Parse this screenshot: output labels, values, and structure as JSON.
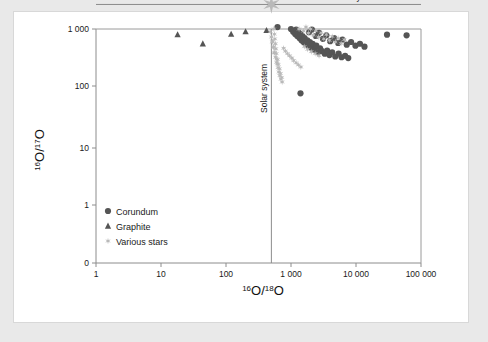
{
  "figure": {
    "background_color": "#e9e9e9",
    "card_color": "#ffffff"
  },
  "legend": {
    "items": [
      {
        "key": "corundum",
        "label": "Corundum",
        "marker": "circle",
        "color": "#555555"
      },
      {
        "key": "graphite",
        "label": "Graphite",
        "marker": "triangle",
        "color": "#555555"
      },
      {
        "key": "various_stars",
        "label": "Various stars",
        "marker": "star",
        "color": "#b9b9b9"
      }
    ]
  },
  "annotations": {
    "vertical_line_label": "Solar system",
    "horizontal_line_label": "Solar system"
  },
  "chart_data": {
    "type": "scatter",
    "title": "",
    "xlabel": "16O/18O",
    "ylabel": "16O/17O",
    "xlabel_parts": {
      "sup1": "16",
      "base1": "O/",
      "sup2": "18",
      "base2": "O"
    },
    "ylabel_parts": {
      "sup1": "16",
      "base1": "O/",
      "sup2": "17",
      "base2": "O"
    },
    "xscale": "log",
    "yscale": "log",
    "xlim": [
      1,
      100000
    ],
    "ylim": [
      0.4,
      1000
    ],
    "grid": false,
    "legend_position": "bottom-left",
    "xticks": [
      1,
      10,
      100,
      1000,
      10000,
      100000
    ],
    "xtick_labels": [
      "1",
      "10",
      "100",
      "1 000",
      "10 000",
      "100 000"
    ],
    "yticks": [
      1000,
      100,
      10,
      1,
      0.4
    ],
    "ytick_labels": [
      "1 000",
      "100",
      "10",
      "1",
      "0"
    ],
    "reference_lines": [
      {
        "name": "solar-system-vertical",
        "orientation": "vertical",
        "x": 499,
        "label": "Solar system",
        "color": "#8c8c8c"
      },
      {
        "name": "solar-system-horizontal",
        "orientation": "horizontal",
        "y": 2620,
        "label": "Solar system",
        "color": "#8c8c8c"
      }
    ],
    "sun_marker": {
      "x": 499,
      "y": 2620,
      "marker": "star",
      "color": "#b9b9b9",
      "size": 22
    },
    "series": [
      {
        "name": "Corundum",
        "marker": "circle",
        "color": "#555555",
        "points": [
          [
            560,
            2200
          ],
          [
            600,
            1900
          ],
          [
            640,
            2400
          ],
          [
            690,
            1700
          ],
          [
            720,
            2000
          ],
          [
            760,
            1500
          ],
          [
            800,
            1800
          ],
          [
            850,
            1300
          ],
          [
            880,
            1600
          ],
          [
            920,
            1150
          ],
          [
            960,
            1400
          ],
          [
            1000,
            1000
          ],
          [
            1040,
            1250
          ],
          [
            1080,
            900
          ],
          [
            1120,
            1100
          ],
          [
            1160,
            820
          ],
          [
            1200,
            980
          ],
          [
            1250,
            760
          ],
          [
            1300,
            880
          ],
          [
            1350,
            700
          ],
          [
            1400,
            820
          ],
          [
            1450,
            640
          ],
          [
            1500,
            760
          ],
          [
            1560,
            600
          ],
          [
            1620,
            700
          ],
          [
            1700,
            560
          ],
          [
            1780,
            640
          ],
          [
            1850,
            520
          ],
          [
            1950,
            600
          ],
          [
            2050,
            480
          ],
          [
            2150,
            560
          ],
          [
            2300,
            440
          ],
          [
            2450,
            520
          ],
          [
            2600,
            400
          ],
          [
            2800,
            470
          ],
          [
            3000,
            420
          ],
          [
            3300,
            380
          ],
          [
            3600,
            430
          ],
          [
            3900,
            360
          ],
          [
            4300,
            400
          ],
          [
            4800,
            340
          ],
          [
            5400,
            380
          ],
          [
            6000,
            330
          ],
          [
            6800,
            350
          ],
          [
            7600,
            320
          ],
          [
            520,
            2700
          ],
          [
            540,
            3100
          ],
          [
            580,
            2900
          ],
          [
            620,
            3400
          ],
          [
            660,
            2600
          ],
          [
            700,
            3000
          ],
          [
            740,
            2500
          ],
          [
            780,
            2800
          ],
          [
            830,
            2300
          ],
          [
            900,
            2600
          ],
          [
            980,
            2200
          ],
          [
            1060,
            2400
          ],
          [
            1150,
            2000
          ],
          [
            1240,
            2200
          ],
          [
            1340,
            1900
          ],
          [
            1460,
            2050
          ],
          [
            1600,
            1750
          ],
          [
            1750,
            1900
          ],
          [
            1900,
            1650
          ],
          [
            2100,
            1780
          ],
          [
            2350,
            1550
          ],
          [
            2600,
            1680
          ],
          [
            2900,
            1450
          ],
          [
            3200,
            1560
          ],
          [
            3600,
            1380
          ],
          [
            460,
            3600
          ],
          [
            480,
            4200
          ],
          [
            500,
            3900
          ],
          [
            520,
            4600
          ],
          [
            560,
            5200
          ],
          [
            600,
            4400
          ],
          [
            650,
            5000
          ],
          [
            700,
            4200
          ],
          [
            760,
            4800
          ],
          [
            830,
            4000
          ],
          [
            910,
            4500
          ],
          [
            1000,
            3800
          ],
          [
            1100,
            4200
          ],
          [
            1220,
            3500
          ],
          [
            1350,
            3900
          ],
          [
            1500,
            3300
          ],
          [
            1700,
            3600
          ],
          [
            1900,
            3100
          ],
          [
            2150,
            3400
          ],
          [
            2450,
            2900
          ],
          [
            420,
            2400
          ],
          [
            440,
            2000
          ],
          [
            470,
            1700
          ],
          [
            490,
            2100
          ],
          [
            510,
            1450
          ],
          [
            530,
            1750
          ],
          [
            560,
            1250
          ],
          [
            590,
            1500
          ],
          [
            620,
            1080
          ],
          [
            660,
            1300
          ],
          [
            1900,
            880
          ],
          [
            2100,
            980
          ],
          [
            2400,
            760
          ],
          [
            2700,
            860
          ],
          [
            3100,
            680
          ],
          [
            3500,
            780
          ],
          [
            4000,
            620
          ],
          [
            4600,
            700
          ],
          [
            5300,
            580
          ],
          [
            6200,
            660
          ],
          [
            7200,
            540
          ],
          [
            8400,
            600
          ],
          [
            9800,
            520
          ],
          [
            11500,
            560
          ],
          [
            13500,
            500
          ],
          [
            700,
            6200
          ],
          [
            800,
            5600
          ],
          [
            900,
            6800
          ],
          [
            1100,
            5200
          ],
          [
            1300,
            5900
          ],
          [
            1600,
            4800
          ],
          [
            2000,
            5400
          ],
          [
            2500,
            4400
          ],
          [
            3100,
            4900
          ],
          [
            3900,
            4100
          ],
          [
            30000,
            800
          ],
          [
            60000,
            780
          ],
          [
            1400,
            80
          ],
          [
            460,
            9000
          ],
          [
            430,
            13000
          ],
          [
            2300,
            10500
          ]
        ]
      },
      {
        "name": "Graphite",
        "marker": "triangle",
        "color": "#555555",
        "points": [
          [
            3.2,
            4400
          ],
          [
            9.5,
            3000
          ],
          [
            14,
            3600
          ],
          [
            21,
            2600
          ],
          [
            26,
            2400
          ],
          [
            33,
            2800
          ],
          [
            40,
            3300
          ],
          [
            48,
            2500
          ],
          [
            56,
            2200
          ],
          [
            65,
            2700
          ],
          [
            75,
            3100
          ],
          [
            86,
            2400
          ],
          [
            98,
            2100
          ],
          [
            110,
            2600
          ],
          [
            125,
            2900
          ],
          [
            140,
            2300
          ],
          [
            158,
            2000
          ],
          [
            175,
            2500
          ],
          [
            195,
            2800
          ],
          [
            215,
            2200
          ],
          [
            240,
            1950
          ],
          [
            265,
            2400
          ],
          [
            290,
            2700
          ],
          [
            315,
            2150
          ],
          [
            345,
            1900
          ],
          [
            375,
            2350
          ],
          [
            405,
            2600
          ],
          [
            440,
            2100
          ],
          [
            470,
            1850
          ],
          [
            500,
            2300
          ],
          [
            18,
            800
          ],
          [
            44,
            560
          ],
          [
            120,
            820
          ],
          [
            200,
            900
          ],
          [
            260,
            1400
          ],
          [
            310,
            1100
          ],
          [
            360,
            1250
          ],
          [
            420,
            950
          ],
          [
            480,
            1500
          ],
          [
            520,
            1200
          ],
          [
            560,
            2000
          ],
          [
            600,
            2500
          ],
          [
            640,
            1800
          ],
          [
            700,
            2200
          ],
          [
            760,
            1600
          ],
          [
            820,
            2000
          ],
          [
            900,
            1400
          ],
          [
            980,
            1750
          ],
          [
            1060,
            1250
          ],
          [
            1400,
            7000
          ],
          [
            560,
            2600
          ],
          [
            580,
            2300
          ],
          [
            610,
            2700
          ],
          [
            650,
            2050
          ]
        ]
      },
      {
        "name": "Various stars",
        "marker": "star",
        "color": "#b9b9b9",
        "points": [
          [
            499,
            2620
          ],
          [
            430,
            2500
          ],
          [
            450,
            2300
          ],
          [
            470,
            2700
          ],
          [
            490,
            2200
          ],
          [
            510,
            2900
          ],
          [
            530,
            2450
          ],
          [
            550,
            2750
          ],
          [
            570,
            2150
          ],
          [
            600,
            2500
          ],
          [
            620,
            1800
          ],
          [
            660,
            1600
          ],
          [
            700,
            1900
          ],
          [
            750,
            1500
          ],
          [
            800,
            1700
          ],
          [
            860,
            1350
          ],
          [
            920,
            1550
          ],
          [
            990,
            1200
          ],
          [
            1060,
            1400
          ],
          [
            1140,
            1100
          ],
          [
            1230,
            1300
          ],
          [
            1330,
            1000
          ],
          [
            1440,
            1180
          ],
          [
            1560,
            920
          ],
          [
            1700,
            1080
          ],
          [
            1850,
            850
          ],
          [
            2000,
            1000
          ],
          [
            2200,
            790
          ],
          [
            2400,
            930
          ],
          [
            2650,
            730
          ],
          [
            2900,
            860
          ],
          [
            3200,
            680
          ],
          [
            3500,
            800
          ],
          [
            3900,
            640
          ],
          [
            4300,
            750
          ],
          [
            4800,
            600
          ],
          [
            5300,
            700
          ],
          [
            5900,
            570
          ],
          [
            6600,
            660
          ],
          [
            520,
            1500
          ],
          [
            530,
            1250
          ],
          [
            545,
            1000
          ],
          [
            555,
            820
          ],
          [
            565,
            680
          ],
          [
            575,
            560
          ],
          [
            585,
            460
          ],
          [
            595,
            380
          ],
          [
            605,
            310
          ],
          [
            615,
            255
          ],
          [
            520,
            620
          ],
          [
            540,
            500
          ],
          [
            560,
            400
          ],
          [
            580,
            330
          ],
          [
            600,
            270
          ],
          [
            480,
            900
          ],
          [
            500,
            730
          ],
          [
            515,
            600
          ],
          [
            535,
            480
          ],
          [
            550,
            390
          ],
          [
            630,
            220
          ],
          [
            650,
            185
          ],
          [
            670,
            160
          ],
          [
            700,
            140
          ],
          [
            730,
            125
          ],
          [
            620,
            300
          ],
          [
            640,
            250
          ],
          [
            665,
            210
          ],
          [
            690,
            175
          ],
          [
            720,
            150
          ],
          [
            450,
            3400
          ],
          [
            470,
            3900
          ],
          [
            490,
            4500
          ],
          [
            510,
            3700
          ],
          [
            530,
            3200
          ],
          [
            770,
            470
          ],
          [
            820,
            420
          ],
          [
            880,
            380
          ],
          [
            950,
            350
          ],
          [
            1030,
            320
          ],
          [
            1100,
            290
          ],
          [
            1200,
            265
          ],
          [
            1300,
            245
          ],
          [
            1420,
            225
          ],
          [
            300,
            2700
          ],
          [
            330,
            2400
          ],
          [
            360,
            2900
          ],
          [
            390,
            2250
          ],
          [
            410,
            2600
          ],
          [
            1600,
            500
          ],
          [
            1800,
            450
          ],
          [
            2050,
            410
          ],
          [
            2350,
            380
          ],
          [
            2700,
            350
          ]
        ]
      }
    ]
  }
}
